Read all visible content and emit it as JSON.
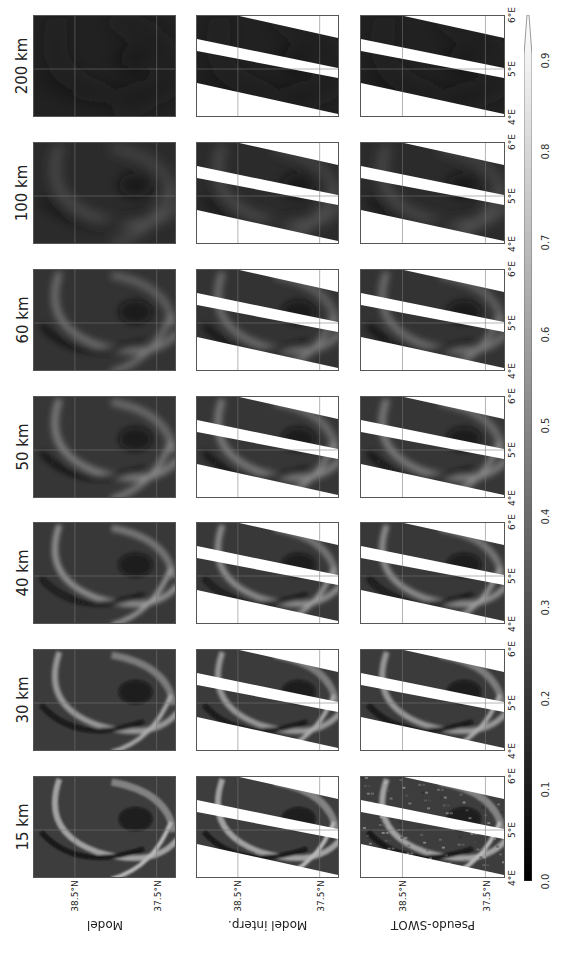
{
  "figure": {
    "orientation": "rotated 90 degrees clockwise",
    "columns": [
      {
        "title": "200 km",
        "blur": 10,
        "dark": 0.13
      },
      {
        "title": "100 km",
        "blur": 6,
        "dark": 0.17
      },
      {
        "title": "60 km",
        "blur": 4,
        "dark": 0.2
      },
      {
        "title": "50 km",
        "blur": 3,
        "dark": 0.21
      },
      {
        "title": "40 km",
        "blur": 2.4,
        "dark": 0.22
      },
      {
        "title": "30 km",
        "blur": 1.8,
        "dark": 0.23
      },
      {
        "title": "15 km",
        "blur": 1.0,
        "dark": 0.24
      }
    ],
    "rows": [
      {
        "label": "Model"
      },
      {
        "label": "Model interp."
      },
      {
        "label": "Pseudo-SWOT"
      }
    ],
    "lat_ticks": [
      "38.5°N",
      "37.5°N"
    ],
    "lon_ticks": [
      "4°E",
      "5°E",
      "6°E"
    ],
    "colorbar": {
      "ticks": [
        "0.0",
        "0.1",
        "0.2",
        "0.3",
        "0.4",
        "0.5",
        "0.6",
        "0.7",
        "0.8",
        "0.9"
      ],
      "colormap": "gray",
      "extend": "max"
    }
  },
  "chart_data": {
    "type": "heatmap",
    "title": "",
    "layout": "3 rows x 7 columns of map panels (figure rotated 90°)",
    "row_labels": [
      "Model",
      "Model interp.",
      "Pseudo-SWOT"
    ],
    "column_titles": [
      "15 km",
      "30 km",
      "40 km",
      "50 km",
      "60 km",
      "100 km",
      "200 km"
    ],
    "xlabel": "Longitude",
    "ylabel": "Latitude",
    "x_ticks": [
      "4°E",
      "5°E",
      "6°E"
    ],
    "y_ticks": [
      "37.5°N",
      "38.5°N"
    ],
    "colorbar": {
      "min": 0.0,
      "max": 0.9,
      "ticks": [
        0.0,
        0.1,
        0.2,
        0.3,
        0.4,
        0.5,
        0.6,
        0.7,
        0.8,
        0.9
      ],
      "cmap": "gray",
      "extend": "max"
    },
    "grid": true
  }
}
